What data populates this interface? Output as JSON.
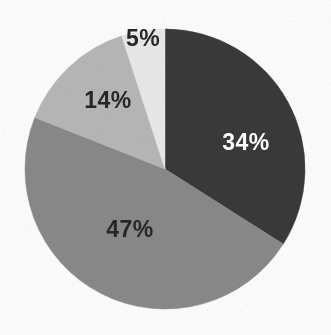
{
  "chart_data": {
    "type": "pie",
    "title": "",
    "subtitle": "",
    "xlabel": "",
    "ylabel": "",
    "legend": "none",
    "grid": false,
    "units": "percent",
    "start_angle_deg": 0,
    "direction": "clockwise",
    "categories": [
      "34%",
      "47%",
      "14%",
      "5%"
    ],
    "values": [
      34,
      47,
      14,
      5
    ],
    "labels": [
      "34%",
      "47%",
      "14%",
      "5%"
    ],
    "colors": [
      "#3a3a3a",
      "#8a8a8a",
      "#b8b8b8",
      "#ebebeb"
    ],
    "slices": [
      {
        "label": "34%",
        "value": 34,
        "color": "#3a3a3a",
        "label_color": "#fdfdfd",
        "start_deg": 0,
        "end_deg": 122.4,
        "label_x": 246,
        "label_y": 142
      },
      {
        "label": "47%",
        "value": 47,
        "color": "#8a8a8a",
        "label_color": "#262626",
        "start_deg": 122.4,
        "end_deg": 291.6,
        "label_x": 130,
        "label_y": 229
      },
      {
        "label": "14%",
        "value": 14,
        "color": "#b8b8b8",
        "label_color": "#262626",
        "start_deg": 291.6,
        "end_deg": 342.0,
        "label_x": 108,
        "label_y": 100
      },
      {
        "label": "5%",
        "value": 5,
        "color": "#ebebeb",
        "label_color": "#262626",
        "start_deg": 342.0,
        "end_deg": 360.0,
        "label_x": 143,
        "label_y": 38
      }
    ],
    "geometry": {
      "center_x": 165,
      "center_y": 169,
      "radius": 140
    },
    "background_color": "#ffffff"
  }
}
